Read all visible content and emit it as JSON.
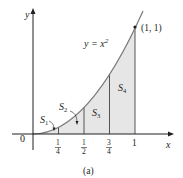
{
  "figure": {
    "caption": "(a)",
    "curve_label": "y = x",
    "curve_exponent": "2",
    "point_label": "(1, 1)",
    "axis_x_label": "x",
    "axis_y_label": "y",
    "origin_label": "0",
    "ticks": [
      {
        "num": "1",
        "den": "4"
      },
      {
        "num": "1",
        "den": "2"
      },
      {
        "num": "3",
        "den": "4"
      },
      {
        "whole": "1"
      }
    ],
    "regions": [
      {
        "label": "S",
        "sub": "1"
      },
      {
        "label": "S",
        "sub": "2"
      },
      {
        "label": "S",
        "sub": "3"
      },
      {
        "label": "S",
        "sub": "4"
      }
    ],
    "colors": {
      "shade": "#e6e6e6",
      "curve": "#7a7a7a",
      "axis": "#231f20"
    }
  }
}
